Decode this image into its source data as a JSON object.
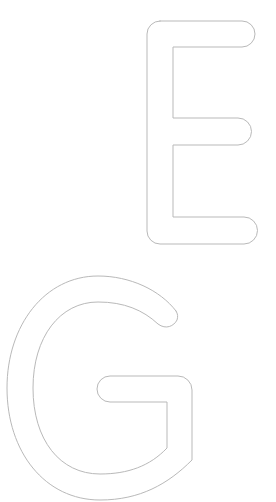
{
  "canvas": {
    "width": 276,
    "height": 502,
    "background": "#ffffff"
  },
  "letters": [
    {
      "char": "E",
      "style": "outline",
      "stroke": "#b9b9b9"
    },
    {
      "char": "G",
      "style": "outline",
      "stroke": "#b9b9b9"
    }
  ]
}
